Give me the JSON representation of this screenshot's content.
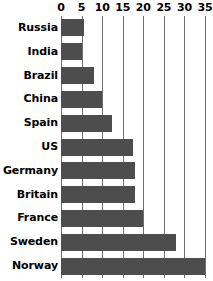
{
  "chart_data": {
    "type": "bar",
    "orientation": "horizontal",
    "title": "",
    "subtitle": "",
    "xlabel": "",
    "ylabel": "",
    "categories": [
      "Russia",
      "India",
      "Brazil",
      "China",
      "Spain",
      "US",
      "Germany",
      "Britain",
      "France",
      "Sweden",
      "Norway"
    ],
    "values": [
      5.5,
      5,
      8,
      10,
      12.5,
      17.5,
      18,
      18,
      20,
      28,
      35
    ],
    "xlim": [
      0,
      35
    ],
    "ylim": null,
    "xticks": [
      0,
      5,
      10,
      15,
      20,
      25,
      30,
      35
    ],
    "xtick_labels": [
      "0",
      "5",
      "10",
      "15",
      "20",
      "25",
      "30",
      "35"
    ],
    "grid": true,
    "grid_axis": "x",
    "legend": false,
    "legend_position": "none",
    "axis_position": "top",
    "series": [
      {
        "name": "value",
        "values": [
          5.5,
          5,
          8,
          10,
          12.5,
          17.5,
          18,
          18,
          20,
          28,
          35
        ]
      }
    ]
  },
  "style": {
    "bar_color": "#4d4d4d",
    "gridline_color": "#6f6f6f",
    "text_color": "#000000",
    "background_color": "#ffffff"
  }
}
